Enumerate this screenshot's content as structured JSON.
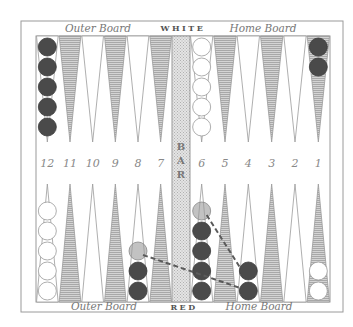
{
  "board": {
    "top_left_label": "Outer Board",
    "top_center_label": "WHITE",
    "top_right_label": "Home Board",
    "bottom_left_label": "Outer Board",
    "bottom_center_label": "RED",
    "bottom_right_label": "Home Board",
    "bar_label": "BAR",
    "point_numbers": [
      "12",
      "11",
      "10",
      "9",
      "8",
      "7",
      "6",
      "5",
      "4",
      "3",
      "2",
      "1"
    ]
  },
  "colors": {
    "frame": "#9a9a9a",
    "shaded_point": "#b8b8b8",
    "dark_checker": "#4a4a4a",
    "white_checker": "#ffffff",
    "ghost_checker": "#9a9a9a",
    "arrow": "#5a5a5a",
    "bar": "#d8d8d8",
    "text": "#777777"
  },
  "checkers": {
    "top": [
      {
        "point": "12",
        "color": "dark",
        "count": 5
      },
      {
        "point": "6",
        "color": "white",
        "count": 5
      },
      {
        "point": "1",
        "color": "dark",
        "count": 2
      }
    ],
    "bottom": [
      {
        "point": "12",
        "color": "white",
        "count": 5
      },
      {
        "point": "8",
        "color": "dark",
        "count": 2,
        "ghost": 1
      },
      {
        "point": "6",
        "color": "dark",
        "count": 4,
        "ghost": 1
      },
      {
        "point": "4",
        "color": "dark",
        "count": 2
      },
      {
        "point": "1",
        "color": "white",
        "count": 2
      }
    ]
  },
  "moves": [
    {
      "from": "8",
      "to": "4"
    },
    {
      "from": "6",
      "to": "4"
    }
  ]
}
